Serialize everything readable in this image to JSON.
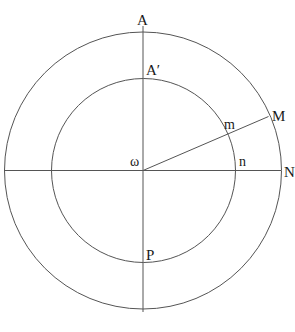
{
  "diagram": {
    "type": "concentric-circles-geometry",
    "center": {
      "x": 143,
      "y": 170
    },
    "outer_circle": {
      "radius": 139
    },
    "inner_circle": {
      "radius": 92
    },
    "ray_angle_deg": 23.4,
    "colors": {
      "stroke": "#555555",
      "text": "#1a1a1a",
      "background": "#ffffff"
    },
    "labels": {
      "A": "A",
      "A_prime": "A′",
      "M": "M",
      "m": "m",
      "omega": "ω",
      "n": "n",
      "N": "N",
      "P": "P"
    }
  }
}
